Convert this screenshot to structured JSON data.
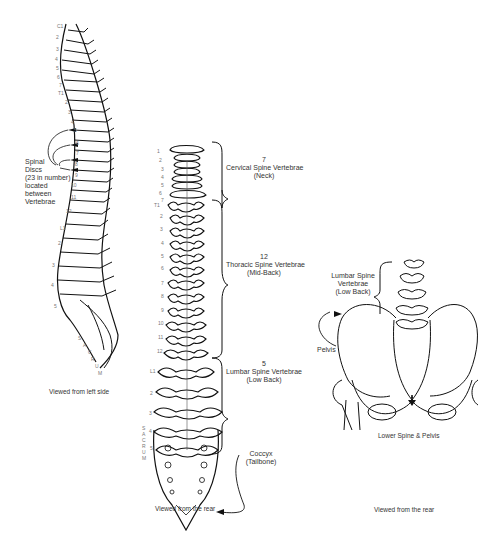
{
  "diagram": {
    "panels": [
      {
        "id": "side_view",
        "caption": "Viewed from left side",
        "vertebra_labels": [
          "C1",
          "2",
          "3",
          "4",
          "5",
          "6",
          "7",
          "T1",
          "2",
          "3",
          "4",
          "5",
          "6",
          "7",
          "8",
          "9",
          "10",
          "11",
          "12",
          "L1",
          "2",
          "3",
          "4",
          "5"
        ],
        "sacrum_letters": [
          "S",
          "A",
          "C",
          "R",
          "U",
          "M"
        ],
        "annotation": {
          "lines": [
            "Spinal",
            "Discs",
            "(23 in number)",
            "located",
            "between",
            "Vertebrae"
          ]
        }
      },
      {
        "id": "rear_view",
        "caption": "Viewed from the rear",
        "cervical_labels": [
          "1",
          "2",
          "3",
          "4",
          "5",
          "6",
          "7"
        ],
        "thoracic_labels": [
          "T1",
          "2",
          "3",
          "4",
          "5",
          "6",
          "7",
          "8",
          "9",
          "10",
          "11",
          "12"
        ],
        "lumbar_labels": [
          "L1",
          "2",
          "3",
          "4",
          "5"
        ],
        "sacrum_letters": [
          "S",
          "A",
          "C",
          "R",
          "U",
          "M"
        ],
        "groups": [
          {
            "count": "7",
            "name": "Cervical Spine Vertebrae",
            "region": "(Neck)"
          },
          {
            "count": "12",
            "name": "Thoracic Spine Vertebrae",
            "region": "(Mid-Back)"
          },
          {
            "count": "5",
            "name": "Lumbar Spine Vertebrae",
            "region": "(Low Back)"
          }
        ],
        "coccyx": {
          "name": "Coccyx",
          "alias": "(Tailbone)"
        }
      },
      {
        "id": "pelvis_view",
        "title": "Lower Spine & Pelvis",
        "caption": "Viewed from the rear",
        "lumbar_label": [
          "Lumbar Spine",
          "Vertebrae",
          "(Low Back)"
        ],
        "pelvis_label": "Pelvis"
      }
    ],
    "colors": {
      "line": "#111111",
      "label": "#333333",
      "number": "#777777"
    }
  }
}
